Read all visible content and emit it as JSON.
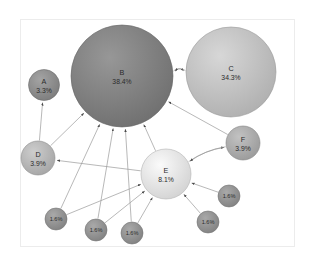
{
  "figure": {
    "background_color": "#ffffff",
    "frame_color": "#ececec",
    "edge_color": "#9a9a9a",
    "label_color": "#2b2b2b"
  },
  "chart_data": {
    "type": "scatter",
    "subtype": "node-link-bubble-graph",
    "title": "",
    "xlabel": "",
    "ylabel": "",
    "grid": false,
    "legend": "none",
    "axis_visible": false,
    "size_encoding": "node radius proportional to percentage",
    "nodes": [
      {
        "id": "A",
        "name": "A",
        "pct_label": "3.3%",
        "value": 3.3,
        "cx": 44,
        "cy": 85,
        "r": 15.5,
        "fill": "#8a8a8a",
        "stroke": "#6f6f6f",
        "label_size": "normal"
      },
      {
        "id": "B",
        "name": "B",
        "pct_label": "38.4%",
        "value": 38.4,
        "cx": 122,
        "cy": 76,
        "r": 51,
        "fill": "#7d7d7d",
        "stroke": "#646464",
        "label_size": "normal"
      },
      {
        "id": "C",
        "name": "C",
        "pct_label": "34.3%",
        "value": 34.3,
        "cx": 231,
        "cy": 72,
        "r": 45,
        "fill": "#bdbdbd",
        "stroke": "#9b9b9b",
        "label_size": "normal"
      },
      {
        "id": "D",
        "name": "D",
        "pct_label": "3.9%",
        "value": 3.9,
        "cx": 38,
        "cy": 158,
        "r": 17,
        "fill": "#b3b3b3",
        "stroke": "#8f8f8f",
        "label_size": "normal"
      },
      {
        "id": "E",
        "name": "E",
        "pct_label": "8.1%",
        "value": 8.1,
        "cx": 166,
        "cy": 174,
        "r": 25,
        "fill": "#e0e0e0",
        "stroke": "#b4b4b4",
        "label_size": "normal"
      },
      {
        "id": "F",
        "name": "F",
        "pct_label": "3.9%",
        "value": 3.9,
        "cx": 243,
        "cy": 143,
        "r": 17,
        "fill": "#a8a8a8",
        "stroke": "#868686",
        "label_size": "normal"
      },
      {
        "id": "S1",
        "name": "",
        "pct_label": "1.6%",
        "value": 1.6,
        "cx": 56,
        "cy": 219,
        "r": 11,
        "fill": "#8f8f8f",
        "stroke": "#737373",
        "label_size": "small"
      },
      {
        "id": "S2",
        "name": "",
        "pct_label": "1.6%",
        "value": 1.6,
        "cx": 96,
        "cy": 230,
        "r": 11,
        "fill": "#8f8f8f",
        "stroke": "#737373",
        "label_size": "small"
      },
      {
        "id": "S3",
        "name": "",
        "pct_label": "1.6%",
        "value": 1.6,
        "cx": 132,
        "cy": 233,
        "r": 11,
        "fill": "#8f8f8f",
        "stroke": "#737373",
        "label_size": "small"
      },
      {
        "id": "S4",
        "name": "",
        "pct_label": "1.6%",
        "value": 1.6,
        "cx": 208,
        "cy": 222,
        "r": 11,
        "fill": "#8f8f8f",
        "stroke": "#737373",
        "label_size": "small"
      },
      {
        "id": "S5",
        "name": "",
        "pct_label": "1.6%",
        "value": 1.6,
        "cx": 229,
        "cy": 196,
        "r": 11,
        "fill": "#8f8f8f",
        "stroke": "#737373",
        "label_size": "small"
      }
    ],
    "edges": [
      {
        "from": "B",
        "to": "C",
        "direction": "forward"
      },
      {
        "from": "C",
        "to": "B",
        "direction": "forward"
      },
      {
        "from": "D",
        "to": "A",
        "direction": "forward"
      },
      {
        "from": "D",
        "to": "B",
        "direction": "forward"
      },
      {
        "from": "E",
        "to": "B",
        "direction": "forward"
      },
      {
        "from": "E",
        "to": "D",
        "direction": "forward"
      },
      {
        "from": "E",
        "to": "F",
        "direction": "forward"
      },
      {
        "from": "F",
        "to": "E",
        "direction": "forward"
      },
      {
        "from": "F",
        "to": "B",
        "direction": "forward"
      },
      {
        "from": "S1",
        "to": "B",
        "direction": "forward"
      },
      {
        "from": "S2",
        "to": "B",
        "direction": "forward"
      },
      {
        "from": "S3",
        "to": "B",
        "direction": "forward"
      },
      {
        "from": "S1",
        "to": "E",
        "direction": "forward"
      },
      {
        "from": "S2",
        "to": "E",
        "direction": "forward"
      },
      {
        "from": "S3",
        "to": "E",
        "direction": "forward"
      },
      {
        "from": "S4",
        "to": "E",
        "direction": "forward"
      },
      {
        "from": "S5",
        "to": "E",
        "direction": "forward"
      }
    ]
  }
}
